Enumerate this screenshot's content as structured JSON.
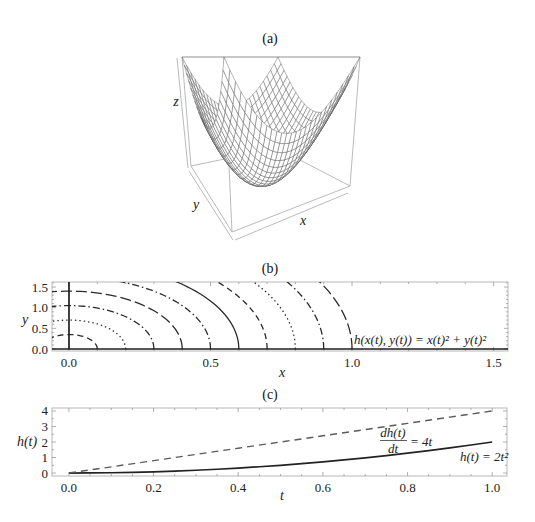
{
  "panels": {
    "a": {
      "title": "(a)",
      "xlabel": "x",
      "ylabel": "y",
      "zlabel": "z"
    },
    "b": {
      "title": "(b)",
      "xlabel": "x",
      "ylabel": "y",
      "annotation": "h(x(t), y(t)) = x(t)² + y(t)²"
    },
    "c": {
      "title": "(c)",
      "xlabel": "t",
      "ylabel": "h(t)",
      "annotation_derivative": {
        "numerator": "dh(t)",
        "denominator": "dt",
        "rhs": "= 4t"
      },
      "annotation_function": "h(t) = 2t²"
    }
  },
  "colors": {
    "mesh": "#4a4a4a",
    "surface_fill": "#ffffff",
    "contour": "#2a2a2a",
    "axis": "#1e1e1e",
    "series_solid": "#222222",
    "series_dashed": "#5a5a5a"
  },
  "chart_data": [
    {
      "type": "surface3d",
      "panel": "(a)",
      "title": "(a)",
      "expression": "z = x^2 + y^2",
      "coefficients": {
        "x2": 1,
        "y2": 1
      },
      "domain": {
        "x": [
          -1,
          1
        ],
        "y": [
          -1,
          1
        ],
        "z": [
          0,
          2
        ]
      },
      "mesh_divisions": 26,
      "axis_labels": {
        "x": "x",
        "y": "y",
        "z": "z"
      },
      "ticks": false,
      "boxed": true
    },
    {
      "type": "contour",
      "panel": "(b)",
      "title": "(b)",
      "xlabel": "x",
      "ylabel": "y",
      "xlim": [
        -0.06,
        1.551
      ],
      "ylim": [
        -0.048,
        1.621
      ],
      "xticks": [
        0,
        0.5,
        1.0,
        1.5
      ],
      "xtick_labels": [
        "0.0",
        "0.5",
        "1.0",
        "1.5"
      ],
      "yticks": [
        0,
        0.5,
        1.0,
        1.5
      ],
      "ytick_labels": [
        "0.0",
        "0.5",
        "1.0",
        "1.5"
      ],
      "grid": false,
      "axes_lines": {
        "x_equals_0": true,
        "y_equals_0": true
      },
      "contours": [
        {
          "x_radius": 0.1,
          "y_radius": 0.35,
          "style": "dashed"
        },
        {
          "x_radius": 0.2,
          "y_radius": 0.7,
          "style": "dotted"
        },
        {
          "x_radius": 0.3,
          "y_radius": 1.05,
          "style": "dashdot"
        },
        {
          "x_radius": 0.4,
          "y_radius": 1.4,
          "style": "longdash"
        },
        {
          "x_radius": 0.5,
          "y_radius": 1.75,
          "style": "dashdot"
        },
        {
          "x_radius": 0.6,
          "y_radius": 2.1,
          "style": "solid"
        },
        {
          "x_radius": 0.7,
          "y_radius": 2.45,
          "style": "dashed"
        },
        {
          "x_radius": 0.8,
          "y_radius": 2.8,
          "style": "dotted"
        },
        {
          "x_radius": 0.9,
          "y_radius": 3.15,
          "style": "dashdot"
        },
        {
          "x_radius": 1.0,
          "y_radius": 3.5,
          "style": "longdash"
        }
      ],
      "annotation": {
        "text": "h(x(t), y(t)) = x(t)² + y(t)²",
        "x": 1.0,
        "y": 0.1
      }
    },
    {
      "type": "line",
      "panel": "(c)",
      "title": "(c)",
      "xlabel": "t",
      "ylabel": "h(t)",
      "xlim": [
        -0.04,
        1.035
      ],
      "ylim": [
        -0.19,
        4.19
      ],
      "xticks": [
        0,
        0.2,
        0.4,
        0.6,
        0.8,
        1.0
      ],
      "xtick_labels": [
        "0.0",
        "0.2",
        "0.4",
        "0.6",
        "0.8",
        "1.0"
      ],
      "yticks": [
        0,
        1,
        2,
        3,
        4
      ],
      "ytick_labels": [
        "0",
        "1",
        "2",
        "3",
        "4"
      ],
      "grid": false,
      "legend": "none (inline labels)",
      "series": [
        {
          "name": "h(t) = 2t²",
          "style": "solid",
          "x": [
            0,
            0.05,
            0.1,
            0.15,
            0.2,
            0.25,
            0.3,
            0.35,
            0.4,
            0.45,
            0.5,
            0.55,
            0.6,
            0.65,
            0.7,
            0.75,
            0.8,
            0.85,
            0.9,
            0.95,
            1.0
          ],
          "y": [
            0,
            0.005,
            0.02,
            0.045,
            0.08,
            0.125,
            0.18,
            0.245,
            0.32,
            0.405,
            0.5,
            0.605,
            0.72,
            0.845,
            0.98,
            1.125,
            1.28,
            1.445,
            1.62,
            1.805,
            2.0
          ]
        },
        {
          "name": "dh(t)/dt = 4t",
          "style": "dashed",
          "x": [
            0,
            0.1,
            0.2,
            0.3,
            0.4,
            0.5,
            0.6,
            0.7,
            0.8,
            0.9,
            1.0
          ],
          "y": [
            0,
            0.4,
            0.8,
            1.2,
            1.6,
            2.0,
            2.4,
            2.8,
            3.2,
            3.6,
            4.0
          ]
        }
      ],
      "annotations": [
        {
          "text": "dh(t)/dt = 4t"
        },
        {
          "text": "h(t) = 2t²"
        }
      ]
    }
  ]
}
